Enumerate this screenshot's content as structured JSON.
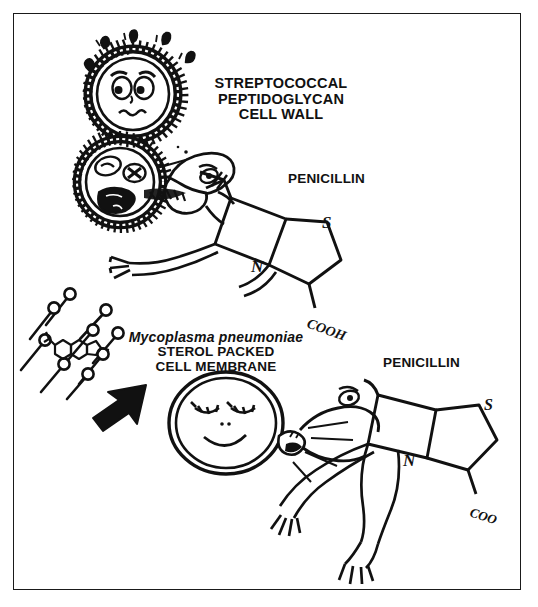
{
  "figure": {
    "kind": "hand-drawn-scientific-cartoon",
    "background_color": "#ffffff",
    "ink_color": "#111111",
    "border": {
      "name": "figure-border",
      "color": "#1a1a1a"
    }
  },
  "labels": {
    "streptococcal_cell_wall": "STREPTOCOCCAL\nPEPTIDOGLYCAN\nCELL WALL",
    "penicillin_top": "PENICILLIN",
    "mycoplasma_species": "Mycoplasma pneumoniae",
    "mycoplasma_membrane": "STEROL PACKED\nCELL MEMBRANE",
    "penicillin_bottom": "PENICILLIN"
  },
  "chemistry": {
    "top_molecule": {
      "name": "penicillin-beta-lactam-structure",
      "sulfur": "S",
      "nitrogen": "N",
      "carboxyl": "COOH"
    },
    "bottom_molecule": {
      "name": "penicillin-beta-lactam-structure",
      "sulfur": "S",
      "nitrogen": "N",
      "carboxyl": "COO"
    }
  },
  "scenes": {
    "top": {
      "name": "penicillin-attacks-streptococcus",
      "characters": [
        "frightened-streptococcus-with-spiky-peptidoglycan-wall",
        "dying-streptococcus-with-x-eyes",
        "penicillin-creature-biting-cell-wall"
      ]
    },
    "bottom": {
      "name": "penicillin-fails-against-mycoplasma",
      "characters": [
        "smiling-mycoplasma-with-smooth-membrane",
        "penicillin-creature-biting-ineffectively"
      ],
      "annotations": [
        "sterol-molecules-scatter",
        "black-arrow-pointing-to-sterols"
      ]
    }
  }
}
